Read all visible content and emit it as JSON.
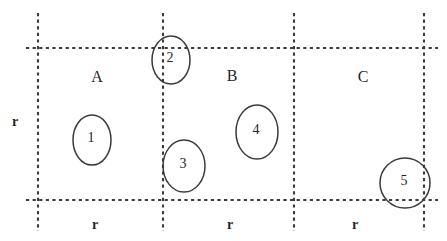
{
  "figure": {
    "kind": "grid-partition-diagram",
    "background_color": "#ffffff",
    "line_color": "#3b3b40",
    "shape_color": "#3a3a3e",
    "text_color": "#26262a",
    "width": 447,
    "height": 241
  },
  "regions": [
    {
      "id": "region-a",
      "label": "A"
    },
    {
      "id": "region-b",
      "label": "B"
    },
    {
      "id": "region-c",
      "label": "C"
    }
  ],
  "axis_labels": {
    "vertical": "r",
    "horizontal": [
      {
        "id": "r-bottom-1",
        "label": "r"
      },
      {
        "id": "r-bottom-2",
        "label": "r"
      },
      {
        "id": "r-bottom-3",
        "label": "r"
      }
    ]
  },
  "items": [
    {
      "id": "item-1",
      "label": "1"
    },
    {
      "id": "item-2",
      "label": "2"
    },
    {
      "id": "item-3",
      "label": "3"
    },
    {
      "id": "item-4",
      "label": "4"
    },
    {
      "id": "item-5",
      "label": "5"
    }
  ]
}
